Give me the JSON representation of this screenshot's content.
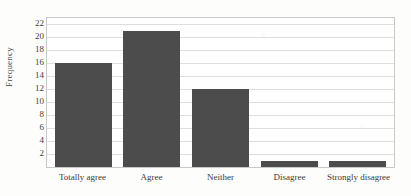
{
  "chart_data": {
    "type": "bar",
    "title": "",
    "xlabel": "",
    "ylabel": "Frequency",
    "categories": [
      "Totally agree",
      "Agree",
      "Neither",
      "Disagree",
      "Strongly disagree"
    ],
    "values": [
      16,
      21,
      12,
      1,
      1
    ],
    "ylim": [
      0,
      23
    ],
    "ytick_step": 2,
    "yticks": [
      22,
      20,
      18,
      16,
      14,
      12,
      10,
      8,
      6,
      4,
      2
    ],
    "grid": "horizontal",
    "legend": "none",
    "bar_color": "#4c4c4c",
    "gridline_color": "#dedede",
    "plot_border_color": "#c9c9c9",
    "background_color": "#fdfdfc"
  }
}
